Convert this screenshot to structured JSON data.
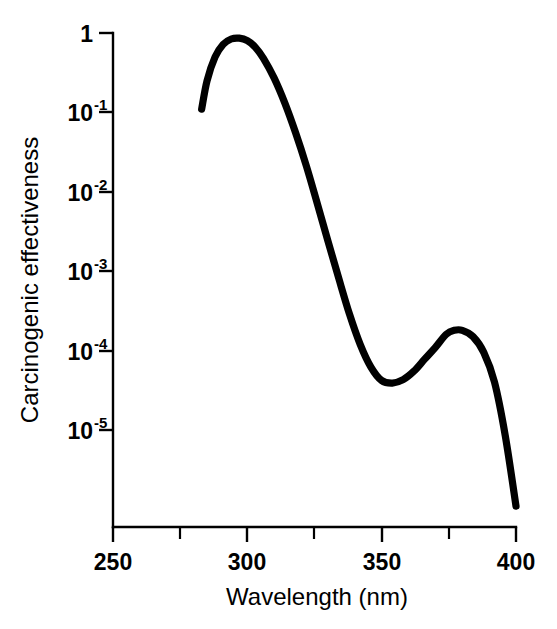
{
  "figure": {
    "background_color": "#ffffff",
    "line_color": "#000000"
  },
  "chart_data": {
    "type": "line",
    "title": "",
    "subtitle": "",
    "xlabel": "Wavelength (nm)",
    "ylabel": "Carcinogenic effectiveness",
    "xlim": [
      250,
      400
    ],
    "ylim": [
      2e-07,
      1
    ],
    "yscale": "log",
    "xscale": "linear",
    "grid": false,
    "legend": null,
    "annotations": [],
    "x_ticks_major": [
      250,
      300,
      350,
      400
    ],
    "x_tick_labels": [
      "250",
      "300",
      "350",
      "400"
    ],
    "x_ticks_minor": [
      275,
      325,
      375
    ],
    "y_ticks_major": [
      1,
      0.1,
      0.01,
      0.001,
      0.0001,
      1e-05
    ],
    "y_tick_labels": [
      "1",
      "10-1",
      "10-2",
      "10-3",
      "10-4",
      "10-5"
    ],
    "y_tick_mantissas": [
      "1",
      "10",
      "10",
      "10",
      "10",
      "10"
    ],
    "y_tick_exponents": [
      "",
      "-1",
      "-2",
      "-3",
      "-4",
      "-5"
    ],
    "series": [
      {
        "name": "Carcinogenic action spectrum",
        "color": "#000000",
        "x": [
          283,
          285,
          288,
          291,
          294,
          297,
          300,
          303,
          306,
          310,
          314,
          318,
          322,
          326,
          330,
          334,
          338,
          342,
          346,
          350,
          354,
          358,
          362,
          366,
          370,
          374,
          377,
          380,
          384,
          388,
          392,
          396,
          400
        ],
        "y": [
          0.11,
          0.25,
          0.5,
          0.72,
          0.84,
          0.86,
          0.8,
          0.66,
          0.48,
          0.27,
          0.13,
          0.055,
          0.021,
          0.0072,
          0.0024,
          0.00082,
          0.00029,
          0.00012,
          6.2e-05,
          4.2e-05,
          3.9e-05,
          4.3e-05,
          5.5e-05,
          7.8e-05,
          0.00011,
          0.00016,
          0.00018,
          0.00018,
          0.00015,
          9.5e-05,
          4e-05,
          8.5e-06,
          1.1e-06
        ]
      }
    ]
  },
  "axis": {
    "x_title": "Wavelength (nm)",
    "y_title": "Carcinogenic effectiveness"
  }
}
